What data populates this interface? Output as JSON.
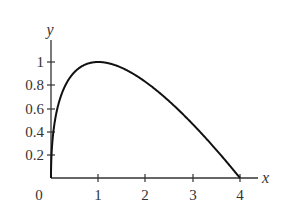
{
  "chart_data": {
    "type": "line",
    "title": "",
    "xlabel": "x",
    "ylabel": "y",
    "function": "y = 2*sqrt(x) - x",
    "xlim": [
      0,
      4
    ],
    "ylim": [
      0,
      1.2
    ],
    "grid": false,
    "legend": null,
    "x_ticks": [
      "1",
      "2",
      "3",
      "4"
    ],
    "y_ticks": [
      "0.2",
      "0.4",
      "0.6",
      "0.8",
      "1"
    ],
    "origin_label": "0",
    "x": [
      0,
      0.05,
      0.1,
      0.25,
      0.5,
      0.75,
      1,
      1.5,
      2,
      2.5,
      3,
      3.5,
      4
    ],
    "series": [
      {
        "name": "curve",
        "values": [
          0,
          0.397,
          0.532,
          0.75,
          0.914,
          0.982,
          1.0,
          0.949,
          0.828,
          0.662,
          0.464,
          0.242,
          0
        ]
      }
    ]
  },
  "colors": {
    "curve": "#111111",
    "axis": "#333333"
  }
}
